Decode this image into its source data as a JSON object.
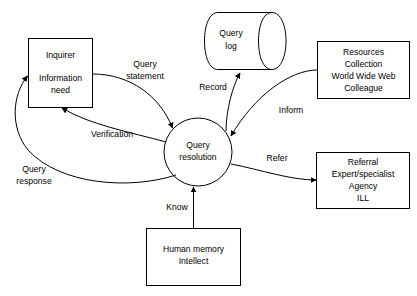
{
  "diagram": {
    "background_color": "#ffffff",
    "line_color": "#000000",
    "nodes": {
      "inquirer": {
        "shape": "rectangle",
        "line1": "Inquirer",
        "line2": "Information",
        "line3": "need"
      },
      "query_log": {
        "shape": "cylinder-datastore",
        "line1": "Query",
        "line2": "log"
      },
      "resources": {
        "shape": "rectangle",
        "line1": "Resources",
        "line2": "Collection",
        "line3": "World Wide Web",
        "line4": "Colleague"
      },
      "query_resolution": {
        "shape": "circle",
        "line1": "Query",
        "line2": "resolution"
      },
      "referral": {
        "shape": "rectangle",
        "line1": "Referral",
        "line2": "Expert/specialist",
        "line3": "Agency",
        "line4": "ILL"
      },
      "human_memory": {
        "shape": "rectangle",
        "line1": "Human memory",
        "line2": "Intellect"
      }
    },
    "flows": {
      "query_statement": {
        "line1": "Query",
        "line2": "statement",
        "from": "inquirer",
        "to": "query_resolution"
      },
      "record": {
        "line1": "Record",
        "from": "query_resolution",
        "to": "query_log"
      },
      "inform": {
        "line1": "Inform",
        "from": "resources",
        "to": "query_resolution"
      },
      "verification": {
        "line1": "Verification",
        "from": "query_resolution",
        "to": "inquirer"
      },
      "query_response": {
        "line1": "Query",
        "line2": "response",
        "from": "query_resolution",
        "to": "inquirer"
      },
      "refer": {
        "line1": "Refer",
        "from": "query_resolution",
        "to": "referral"
      },
      "know": {
        "line1": "Know",
        "from": "human_memory",
        "to": "query_resolution"
      }
    }
  }
}
